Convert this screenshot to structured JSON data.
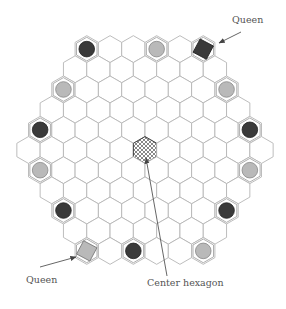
{
  "diagram": {
    "type": "hex-hex game board",
    "board_side": 6,
    "row_lengths": [
      6,
      7,
      8,
      9,
      10,
      11,
      10,
      9,
      8,
      7,
      6
    ],
    "colors": {
      "hex_stroke": "#b5b5b5",
      "dark_piece": "#3a3a3a",
      "light_piece": "#b9b9b9",
      "piece_ring": "#9a9a9a",
      "center_hatch": "#555555",
      "arrow": "#555555"
    },
    "pieces": [
      {
        "row": 0,
        "col": 0,
        "color": "dark",
        "shape": "disc"
      },
      {
        "row": 0,
        "col": 3,
        "color": "light",
        "shape": "disc"
      },
      {
        "row": 0,
        "col": 5,
        "color": "dark",
        "shape": "queen"
      },
      {
        "row": 2,
        "col": 0,
        "color": "light",
        "shape": "disc"
      },
      {
        "row": 2,
        "col": 7,
        "color": "light",
        "shape": "disc"
      },
      {
        "row": 4,
        "col": 0,
        "color": "dark",
        "shape": "disc"
      },
      {
        "row": 4,
        "col": 9,
        "color": "dark",
        "shape": "disc"
      },
      {
        "row": 6,
        "col": 0,
        "color": "light",
        "shape": "disc"
      },
      {
        "row": 6,
        "col": 9,
        "color": "light",
        "shape": "disc"
      },
      {
        "row": 8,
        "col": 0,
        "color": "dark",
        "shape": "disc"
      },
      {
        "row": 8,
        "col": 7,
        "color": "dark",
        "shape": "disc"
      },
      {
        "row": 10,
        "col": 0,
        "color": "light",
        "shape": "queen"
      },
      {
        "row": 10,
        "col": 2,
        "color": "dark",
        "shape": "disc"
      },
      {
        "row": 10,
        "col": 5,
        "color": "light",
        "shape": "disc"
      }
    ],
    "center": {
      "row": 5,
      "col": 5,
      "pattern": "crosshatch"
    },
    "labels": {
      "queen_top": "Queen",
      "queen_bottom": "Queen",
      "center": "Center hexagon"
    },
    "arrows": [
      {
        "name": "queen-top-arrow",
        "from": [
          241,
          32
        ],
        "to": [
          219,
          43
        ]
      },
      {
        "name": "queen-bottom-arrow",
        "from": [
          40,
          267
        ],
        "to": [
          76,
          257
        ]
      },
      {
        "name": "center-arrow",
        "from": [
          167,
          276
        ],
        "to": [
          146,
          158
        ]
      }
    ]
  }
}
